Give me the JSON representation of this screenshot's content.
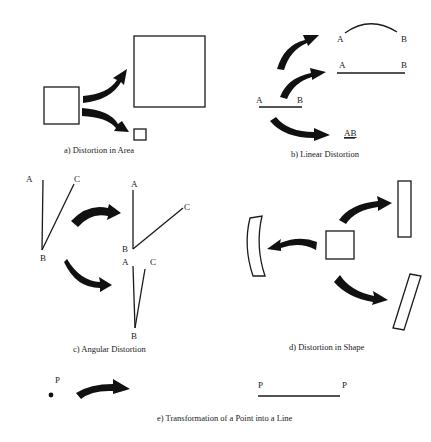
{
  "figure": {
    "panels": [
      {
        "id": "a",
        "caption": "a) Distortion in Area"
      },
      {
        "id": "b",
        "caption": "b) Linear Distortion",
        "labels": {
          "orig_a": "A",
          "orig_b": "B",
          "arc_a": "A",
          "arc_b": "B",
          "long_a": "A",
          "long_b": "B",
          "short_ab": "AB"
        }
      },
      {
        "id": "c",
        "caption": "c) Angular Distortion",
        "labels": {
          "orig_a": "A",
          "orig_b": "B",
          "orig_c": "C",
          "wide_a": "A",
          "wide_b": "B",
          "wide_c": "C",
          "narrow_a": "A",
          "narrow_b": "B",
          "narrow_c": "C"
        }
      },
      {
        "id": "d",
        "caption": "d) Distortion in Shape"
      },
      {
        "id": "e",
        "caption": "e) Transformation of a Point into a Line",
        "labels": {
          "point": "P",
          "line_left": "P",
          "line_right": "P"
        }
      }
    ]
  },
  "colors": {
    "ink": "#1a1a1a",
    "background": "#ffffff"
  }
}
